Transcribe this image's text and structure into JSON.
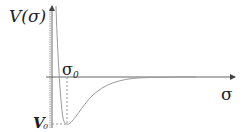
{
  "diagram": {
    "y_axis_label": "V(σ)",
    "x_axis_label": "σ",
    "equilibrium_label": "σ",
    "equilibrium_subscript": "0",
    "well_depth_label": "V",
    "well_depth_subscript": "0",
    "colors": {
      "curve": "#9a9a9a",
      "axis": "#555555",
      "dashed": "#888888",
      "text": "#222222",
      "background": "#ffffff"
    }
  }
}
